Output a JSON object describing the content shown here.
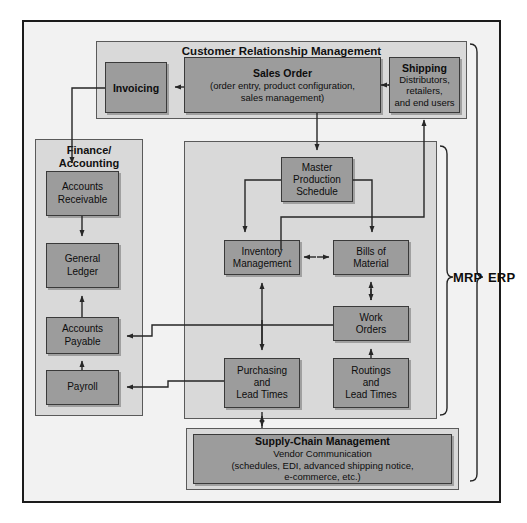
{
  "diagram": {
    "colors": {
      "node_fill": "#9c9c9c",
      "panel_fill": "#d9d9d9",
      "canvas_fill": "#f2f2f2",
      "stroke": "#3a3a3a",
      "text": "#0d0d0d"
    }
  },
  "panels": {
    "crm": {
      "title": "Customer Relationship Management"
    },
    "finance": {
      "title": "Finance/\nAccounting"
    },
    "mrp": {
      "title": ""
    },
    "scm_outer": {
      "title": ""
    }
  },
  "nodes": {
    "invoicing": {
      "title": "Invoicing",
      "sub": ""
    },
    "sales_order": {
      "title": "Sales Order",
      "sub": "(order entry, product configuration,\nsales management)"
    },
    "shipping": {
      "title": "Shipping",
      "sub": "Distributors,\nretailers,\nand end users"
    },
    "accounts_receivable": {
      "title": "",
      "sub": "Accounts\nReceivable"
    },
    "general_ledger": {
      "title": "",
      "sub": "General\nLedger"
    },
    "accounts_payable": {
      "title": "",
      "sub": "Accounts\nPayable"
    },
    "payroll": {
      "title": "",
      "sub": "Payroll"
    },
    "master_production_schedule": {
      "title": "",
      "sub": "Master\nProduction\nSchedule"
    },
    "inventory_management": {
      "title": "",
      "sub": "Inventory\nManagement"
    },
    "bills_of_material": {
      "title": "",
      "sub": "Bills of\nMaterial"
    },
    "work_orders": {
      "title": "",
      "sub": "Work\nOrders"
    },
    "purchasing_lead_times": {
      "title": "",
      "sub": "Purchasing\nand\nLead Times"
    },
    "routings_lead_times": {
      "title": "",
      "sub": "Routings\nand\nLead Times"
    },
    "supply_chain_management": {
      "title": "Supply-Chain Management",
      "sub": "Vendor Communication\n(schedules, EDI, advanced shipping notice,\ne-commerce, etc.)"
    }
  },
  "brackets": {
    "mrp_label": "MRP",
    "erp_label": "ERP"
  }
}
